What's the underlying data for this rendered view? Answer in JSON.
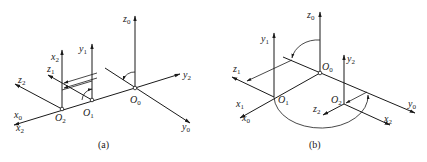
{
  "figures": [
    {
      "id": "a",
      "caption": "(a)",
      "origins": [
        {
          "label": "O",
          "sub": "0"
        },
        {
          "label": "O",
          "sub": "1"
        },
        {
          "label": "O",
          "sub": "2"
        }
      ],
      "axes": [
        {
          "label": "z",
          "sub": "0"
        },
        {
          "label": "y",
          "sub": "0"
        },
        {
          "label": "y",
          "sub": "2"
        },
        {
          "label": "y",
          "sub": "1"
        },
        {
          "label": "z",
          "sub": "1"
        },
        {
          "label": "x",
          "sub": "2"
        },
        {
          "label": "z",
          "sub": "2"
        },
        {
          "label": "x",
          "sub": "0"
        },
        {
          "label": "x",
          "sub": "2"
        }
      ]
    },
    {
      "id": "b",
      "caption": "(b)",
      "origins": [
        {
          "label": "O",
          "sub": "0"
        },
        {
          "label": "O",
          "sub": "1"
        },
        {
          "label": "O",
          "sub": "2"
        }
      ],
      "axes": [
        {
          "label": "z",
          "sub": "0"
        },
        {
          "label": "y",
          "sub": "1"
        },
        {
          "label": "y",
          "sub": "2"
        },
        {
          "label": "z",
          "sub": "1"
        },
        {
          "label": "x",
          "sub": "1"
        },
        {
          "label": "x",
          "sub": "0"
        },
        {
          "label": "z",
          "sub": "2"
        },
        {
          "label": "x",
          "sub": "2"
        },
        {
          "label": "y",
          "sub": "0"
        }
      ]
    }
  ]
}
